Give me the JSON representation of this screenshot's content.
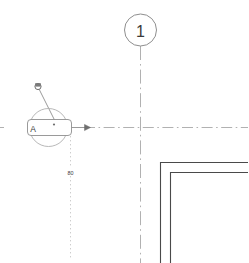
{
  "drawing": {
    "type": "architectural-plan-fragment",
    "background_color": "#ffffff",
    "line_color": "#9a9a9a",
    "wall_color": "#4a4a4a",
    "text_color": "#3a3a3a",
    "grid_bubble": {
      "label": "1",
      "center_x": 140,
      "center_y": 30,
      "radius": 16
    },
    "detail_callout": {
      "label": "A",
      "center_x": 48,
      "center_y": 127,
      "radius": 19
    },
    "dimension": {
      "value": "80",
      "x": 70,
      "y": 172
    },
    "view_direction_arrow": {
      "label": "section-arrow",
      "x": 88,
      "y": 127
    },
    "leader_marker": {
      "label": "revision-marker",
      "x": 38,
      "y": 87
    },
    "center_lines": {
      "horizontal_y": 127,
      "vertical_x": 140
    },
    "walls": {
      "outer_corner_x": 160,
      "outer_corner_y": 162,
      "inner_corner_x": 170,
      "inner_corner_y": 172
    }
  }
}
